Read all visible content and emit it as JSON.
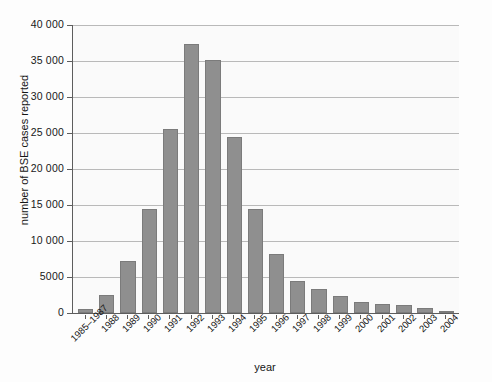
{
  "chart_data": {
    "type": "bar",
    "title": "",
    "xlabel": "year",
    "ylabel": "number of BSE cases reported",
    "categories": [
      "1985–1987",
      "1988",
      "1989",
      "1990",
      "1991",
      "1992",
      "1993",
      "1994",
      "1995",
      "1996",
      "1997",
      "1998",
      "1999",
      "2000",
      "2001",
      "2002",
      "2003",
      "2004"
    ],
    "values": [
      600,
      2500,
      7200,
      14400,
      25600,
      37300,
      35200,
      24500,
      14500,
      8200,
      4400,
      3300,
      2300,
      1500,
      1250,
      1150,
      650,
      300
    ],
    "ylim": [
      0,
      40000
    ],
    "ytick_values": [
      0,
      5000,
      10000,
      15000,
      20000,
      25000,
      30000,
      35000,
      40000
    ],
    "ytick_labels": [
      "0",
      "5000",
      "10 000",
      "15 000",
      "20 000",
      "25 000",
      "30 000",
      "35 000",
      "40 000"
    ],
    "grid": true,
    "legend": false,
    "bar_color": "#8f8f8f",
    "bar_edge_color": "#7b7b7b",
    "gridline_color": "#b9b9b9",
    "axis_color": "#5d5d5d",
    "plot_background": "#fafafa",
    "figure_background": "#fdfdfd"
  }
}
